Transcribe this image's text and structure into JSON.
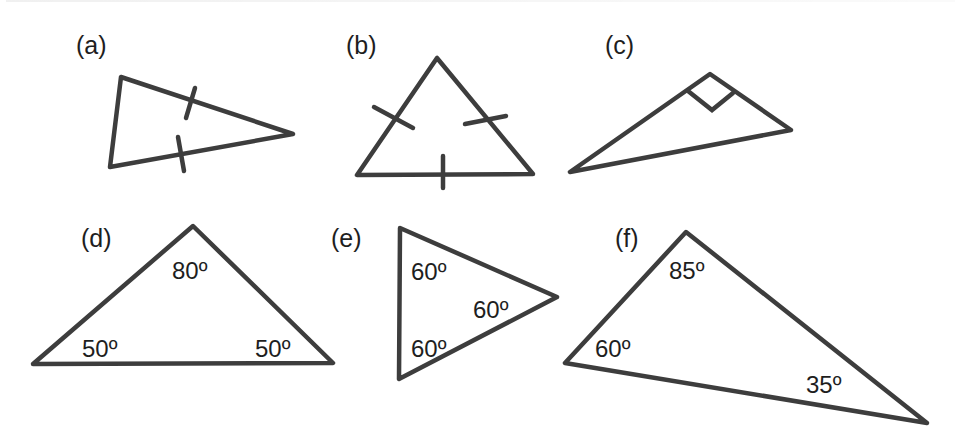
{
  "figure": {
    "line_color": "#3d3d3d",
    "text_color": "#1e1e1e",
    "top_clipped_text": "",
    "triangles": [
      {
        "id": "a",
        "label": "(a)",
        "label_pos": [
          76,
          33
        ],
        "vertices": [
          [
            121,
            77
          ],
          [
            110,
            167
          ],
          [
            293,
            134
          ]
        ],
        "markings": "two equal sides (tick marks)",
        "ticks": [
          [
            [
              195,
              88
            ],
            [
              186,
              118
            ]
          ],
          [
            [
              178,
              137
            ],
            [
              184,
              171
            ]
          ]
        ],
        "angles": []
      },
      {
        "id": "b",
        "label": "(b)",
        "label_pos": [
          346,
          33
        ],
        "vertices": [
          [
            437,
            58
          ],
          [
            357,
            175
          ],
          [
            533,
            174
          ]
        ],
        "markings": "three equal sides (tick marks)",
        "ticks": [
          [
            [
              374,
              107
            ],
            [
              413,
              128
            ]
          ],
          [
            [
              465,
              124
            ],
            [
              506,
              116
            ]
          ],
          [
            [
              443,
              156
            ],
            [
              443,
              188
            ]
          ]
        ],
        "angles": []
      },
      {
        "id": "c",
        "label": "(c)",
        "label_pos": [
          605,
          33
        ],
        "vertices": [
          [
            710,
            74
          ],
          [
            570,
            172
          ],
          [
            791,
            130
          ]
        ],
        "markings": "right angle square",
        "right_angle": [
          [
            688,
            91
          ],
          [
            712,
            110
          ],
          [
            733,
            93
          ]
        ],
        "angles": []
      },
      {
        "id": "d",
        "label": "(d)",
        "label_pos": [
          81,
          226
        ],
        "vertices": [
          [
            33,
            364
          ],
          [
            193,
            226
          ],
          [
            333,
            363
          ]
        ],
        "angles": [
          {
            "text": "80º",
            "pos": [
              172,
              257
            ]
          },
          {
            "text": "50º",
            "pos": [
              82,
              335
            ]
          },
          {
            "text": "50º",
            "pos": [
              255,
              335
            ]
          }
        ]
      },
      {
        "id": "e",
        "label": "(e)",
        "label_pos": [
          331,
          226
        ],
        "vertices": [
          [
            400,
            228
          ],
          [
            557,
            297
          ],
          [
            399,
            379
          ]
        ],
        "angles": [
          {
            "text": "60º",
            "pos": [
              411,
              258
            ]
          },
          {
            "text": "60º",
            "pos": [
              473,
              296
            ]
          },
          {
            "text": "60º",
            "pos": [
              411,
              335
            ]
          }
        ]
      },
      {
        "id": "f",
        "label": "(f)",
        "label_pos": [
          615,
          226
        ],
        "vertices": [
          [
            686,
            232
          ],
          [
            565,
            363
          ],
          [
            927,
            423
          ]
        ],
        "angles": [
          {
            "text": "85º",
            "pos": [
              669,
              257
            ]
          },
          {
            "text": "60º",
            "pos": [
              595,
              335
            ]
          },
          {
            "text": "35º",
            "pos": [
              806,
              371
            ]
          }
        ]
      }
    ]
  }
}
